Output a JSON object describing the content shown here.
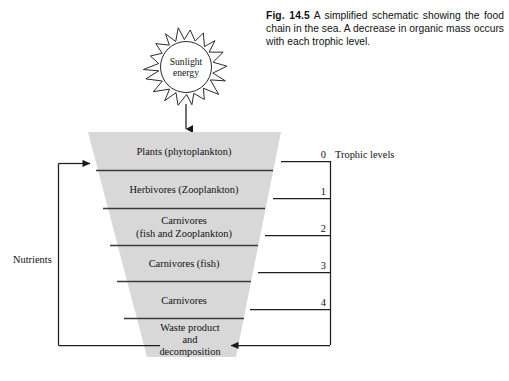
{
  "figure": {
    "label": "Fig. 14.5",
    "caption_text": " A simplified schematic showing the food chain in the sea. A decrease in organic mass occurs with each trophic level."
  },
  "sun": {
    "line1": "Sunlight",
    "line2": "energy",
    "rays": 18
  },
  "nutrients": {
    "label": "Nutrients"
  },
  "axis": {
    "title": "Trophic levels"
  },
  "chart_data": {
    "type": "funnel",
    "title": "Food chain in the sea",
    "note": "Inverted pyramid (funnel): band width decreases downward, representing decreasing organic mass with each trophic level.",
    "bands": [
      {
        "lines": [
          "Plants (phytoplankton)"
        ],
        "trophic_level": "0",
        "y_top": 132,
        "y_bottom": 170
      },
      {
        "lines": [
          "Herbivores (Zooplankton)"
        ],
        "trophic_level": "1",
        "y_top": 170,
        "y_bottom": 208
      },
      {
        "lines": [
          "Carnivores",
          "(fish and Zooplankton)"
        ],
        "trophic_level": "2",
        "y_top": 208,
        "y_bottom": 245
      },
      {
        "lines": [
          "Carnivores (fish)"
        ],
        "trophic_level": "3",
        "y_top": 245,
        "y_bottom": 281
      },
      {
        "lines": [
          "Carnivores"
        ],
        "trophic_level": "4",
        "y_top": 281,
        "y_bottom": 318
      },
      {
        "lines": [
          "Waste  product",
          "and",
          "decomposition"
        ],
        "trophic_level": "",
        "y_top": 318,
        "y_bottom": 357
      }
    ],
    "trophic_levels": [
      "0",
      "1",
      "2",
      "3",
      "4"
    ],
    "colors": {
      "band_fill": "#d8d8d8",
      "line": "#2b2b2b",
      "text": "#111111",
      "background": "#ffffff"
    }
  }
}
